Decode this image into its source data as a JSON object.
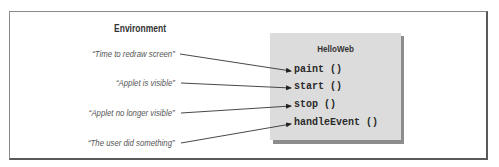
{
  "environment": {
    "title": "Environment",
    "events": [
      {
        "label": "“Time to redraw screen”",
        "target": "paint ()"
      },
      {
        "label": "“Applet is visible”",
        "target": "start ()"
      },
      {
        "label": "“Applet no longer visible”",
        "target": "stop ()"
      },
      {
        "label": "“The user did something”",
        "target": "handleEvent ()"
      }
    ]
  },
  "class_box": {
    "title": "HelloWeb",
    "methods": [
      "paint ()",
      "start ()",
      "stop ()",
      "handleEvent ()"
    ]
  },
  "colors": {
    "box_fill": "#dcdcdc",
    "box_shadow": "#8c8c8c",
    "frame": "#6e6e6e",
    "text": "#333333"
  }
}
